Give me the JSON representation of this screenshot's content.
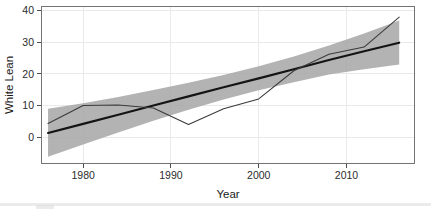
{
  "chart_data": {
    "type": "line",
    "title": "",
    "xlabel": "Year",
    "ylabel": "White Lean",
    "xlim": [
      1975.2,
      2017.8
    ],
    "ylim": [
      -8.5,
      41.5
    ],
    "xticks": [
      1980,
      1990,
      2000,
      2010
    ],
    "xtick_labels": [
      "1980",
      "1990",
      "2000",
      "2010"
    ],
    "yticks": [
      0,
      10,
      20,
      30,
      40
    ],
    "ytick_labels": [
      "0",
      "10",
      "20",
      "30",
      "40"
    ],
    "grid": true,
    "legend": "none",
    "series": [
      {
        "name": "trend-fit",
        "type": "line",
        "color": "#141414",
        "x": [
          1976,
          1980,
          1984,
          1988,
          1992,
          1996,
          2000,
          2004,
          2008,
          2012,
          2016
        ],
        "values": [
          1.3,
          4.2,
          7.1,
          10.0,
          12.9,
          15.8,
          18.6,
          21.5,
          24.4,
          27.2,
          29.9
        ]
      },
      {
        "name": "observed",
        "type": "line",
        "color": "#3a3a3a",
        "x": [
          1976,
          1980,
          1984,
          1988,
          1992,
          1996,
          2000,
          2004,
          2008,
          2012,
          2016
        ],
        "values": [
          4.3,
          10.0,
          10.2,
          9.2,
          4.0,
          9.0,
          12.1,
          21.0,
          26.2,
          28.5,
          38.0
        ]
      }
    ],
    "ribbon": {
      "name": "confidence-band",
      "color": "#a6a6a6",
      "x": [
        1976,
        1980,
        1984,
        1988,
        1992,
        1996,
        2000,
        2004,
        2008,
        2012,
        2016
      ],
      "lower": [
        -6.2,
        -2.3,
        1.5,
        5.2,
        8.7,
        11.9,
        14.8,
        17.4,
        19.8,
        21.5,
        23.0
      ],
      "upper": [
        9.0,
        10.7,
        12.7,
        14.9,
        17.2,
        19.7,
        22.4,
        25.5,
        29.0,
        32.8,
        36.9
      ]
    }
  },
  "axis": {
    "x_title": "Year",
    "y_title": "White Lean"
  }
}
